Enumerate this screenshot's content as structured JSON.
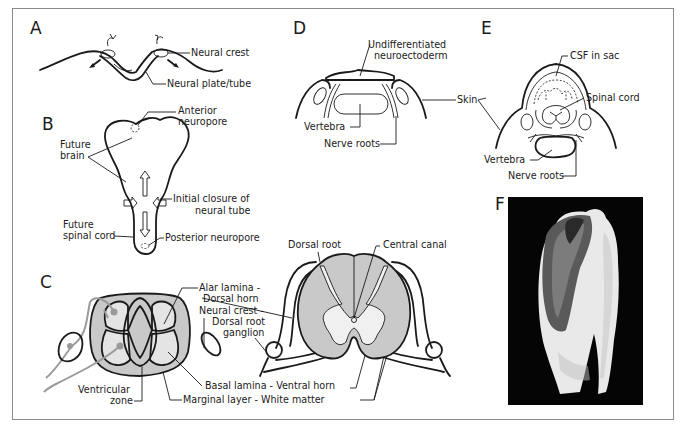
{
  "figure": {
    "panels": {
      "A": {
        "letter": "A",
        "labels": {
          "neural_crest": "Neural crest",
          "neural_plate_tube": "Neural plate/tube"
        }
      },
      "B": {
        "letter": "B",
        "labels": {
          "anterior_neuropore_1": "Anterior",
          "anterior_neuropore_2": "neuropore",
          "future_brain_1": "Future",
          "future_brain_2": "brain",
          "initial_closure_1": "Initial closure of",
          "initial_closure_2": "neural tube",
          "future_spinal_cord_1": "Future",
          "future_spinal_cord_2": "spinal cord",
          "posterior_neuropore": "Posterior neuropore"
        }
      },
      "C": {
        "letter": "C",
        "labels": {
          "alar_lamina_1": "Alar lamina -",
          "alar_lamina_2": "Dorsal horn",
          "neural_crest_1": "Neural crest -",
          "neural_crest_2": "Dorsal root",
          "neural_crest_3": "ganglion",
          "ventricular_zone_1": "Ventricular",
          "ventricular_zone_2": "zone",
          "basal_lamina": "Basal lamina - Ventral horn",
          "marginal_layer": "Marginal layer - White matter",
          "dorsal_root": "Dorsal root",
          "central_canal": "Central canal"
        }
      },
      "D": {
        "letter": "D",
        "labels": {
          "undifferentiated_1": "Undifferentiated",
          "undifferentiated_2": "neuroectoderm",
          "vertebra": "Vertebra",
          "nerve_roots": "Nerve roots",
          "skin": "Skin"
        }
      },
      "E": {
        "letter": "E",
        "labels": {
          "csf_in_sac": "CSF in sac",
          "spinal_cord": "Spinal cord",
          "vertebra": "Vertebra",
          "nerve_roots": "Nerve roots"
        }
      },
      "F": {
        "letter": "F",
        "photo_description": "Photograph of patient's back showing open neural tube defect"
      }
    },
    "colors": {
      "line": "#1a1a1a",
      "gray_fill": "#c9c9c9",
      "light_fill": "#e4e4e4",
      "arrow_gray": "#9a9a9a",
      "frame": "#8a8a8a",
      "photo_bg": "#050505"
    }
  }
}
